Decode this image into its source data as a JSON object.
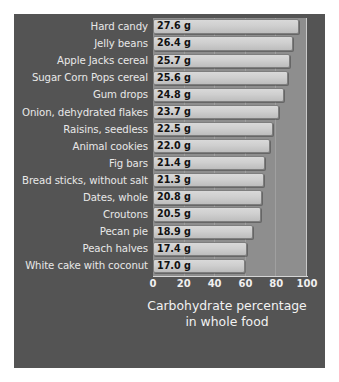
{
  "chart_data": {
    "type": "bar",
    "orientation": "horizontal",
    "title": "",
    "xlabel": "Carbohydrate percentage in whole food",
    "xlabel_lines": [
      "Carbohydrate percentage",
      "in whole food"
    ],
    "ylabel": "",
    "xlim": [
      0,
      100
    ],
    "xticks": [
      0,
      20,
      40,
      60,
      80,
      100
    ],
    "xtick_labels": [
      "0",
      "20",
      "40",
      "60",
      "80",
      "100"
    ],
    "grid": true,
    "grid_axis": "x",
    "legend": false,
    "categories": [
      "Hard candy",
      "Jelly beans",
      "Apple Jacks cereal",
      "Sugar Corn Pops cereal",
      "Gum drops",
      "Onion, dehydrated flakes",
      "Raisins, seedless",
      "Animal cookies",
      "Fig bars",
      "Bread sticks, without salt",
      "Dates, whole",
      "Croutons",
      "Pecan pie",
      "Peach halves",
      "White cake with coconut"
    ],
    "values": [
      95,
      91,
      89,
      88,
      85,
      82,
      78,
      76,
      73,
      72,
      71,
      70,
      65,
      61,
      60
    ],
    "data_labels": [
      "27.6 g",
      "26.4 g",
      "25.7 g",
      "25.6 g",
      "24.8 g",
      "23.7 g",
      "22.5 g",
      "22.0 g",
      "21.4 g",
      "21.3 g",
      "20.8 g",
      "20.5 g",
      "18.9 g",
      "17.4 g",
      "17.0 g"
    ],
    "grams": [
      27.6,
      26.4,
      25.7,
      25.6,
      24.8,
      23.7,
      22.5,
      22.0,
      21.4,
      21.3,
      20.8,
      20.5,
      18.9,
      17.4,
      17.0
    ],
    "colors": {
      "figure_background": "#545454",
      "plot_background": "#8e8e8e",
      "bar_fill": "#cfcfcf",
      "bar_edge": "#7e7e7e",
      "category_text": "#e8e8e8",
      "value_text": "#111111",
      "tick_text": "#f0f0f0"
    }
  }
}
